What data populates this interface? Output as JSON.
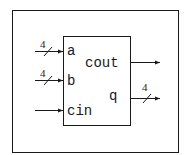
{
  "diagram": {
    "type": "block-diagram",
    "block": {
      "inputs": [
        {
          "name": "a",
          "width": "4"
        },
        {
          "name": "b",
          "width": "4"
        },
        {
          "name": "cin",
          "width": ""
        }
      ],
      "outputs": [
        {
          "name": "cout",
          "width": ""
        },
        {
          "name": "q",
          "width": "4"
        }
      ]
    },
    "colors": {
      "stroke": "#1a1a1a",
      "background": "#ffffff"
    }
  }
}
